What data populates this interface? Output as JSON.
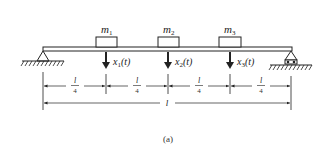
{
  "diagram": {
    "masses": [
      {
        "label": "m",
        "sub": "1",
        "disp": "x",
        "disp_sub": "1",
        "disp_arg": "(t)"
      },
      {
        "label": "m",
        "sub": "2",
        "disp": "x",
        "disp_sub": "2",
        "disp_arg": "(t)"
      },
      {
        "label": "m",
        "sub": "3",
        "disp": "x",
        "disp_sub": "3",
        "disp_arg": "(t)"
      }
    ],
    "segments": [
      {
        "num": "l",
        "den": "4"
      },
      {
        "num": "l",
        "den": "4"
      },
      {
        "num": "l",
        "den": "4"
      },
      {
        "num": "l",
        "den": "4"
      }
    ],
    "total_length": "l",
    "left_support": "pin",
    "right_support": "roller",
    "caption": "(a)"
  }
}
